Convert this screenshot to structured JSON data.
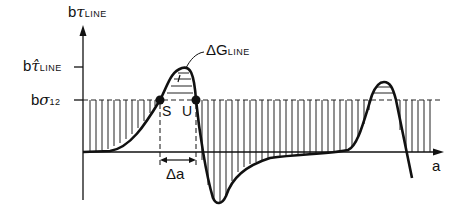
{
  "diagram": {
    "y_axis": {
      "label_prefix": "b",
      "label_symbol": "τ",
      "label_sub": "LINE"
    },
    "x_axis": {
      "label": "a"
    },
    "levels": [
      {
        "prefix": "b",
        "symbol": "τ̂",
        "sub": "LINE"
      },
      {
        "prefix": "b",
        "symbol": "σ",
        "sub": "12"
      }
    ],
    "annotations": {
      "energy": {
        "symbol": "ΔG",
        "sub": "LINE"
      },
      "stable_point": "S",
      "unstable_point": "U",
      "delta_a": "Δa"
    },
    "colors": {
      "ink": "#111111",
      "background": "#ffffff"
    }
  }
}
